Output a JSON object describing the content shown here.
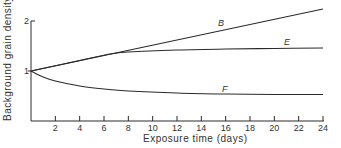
{
  "chart_data": {
    "type": "line",
    "title": "",
    "xlabel": "Exposure time (days)",
    "ylabel": "Background grain density",
    "xlim": [
      0,
      24
    ],
    "ylim": [
      0,
      2
    ],
    "x_ticks": [
      2,
      4,
      6,
      8,
      10,
      12,
      14,
      16,
      18,
      20,
      22,
      24
    ],
    "y_ticks": [
      1,
      2
    ],
    "grid": false,
    "legend": "inline labels",
    "series": [
      {
        "name": "B",
        "x": [
          0,
          6,
          12,
          18,
          24
        ],
        "y": [
          1.0,
          1.31,
          1.62,
          1.93,
          2.24
        ]
      },
      {
        "name": "E",
        "x": [
          0,
          4,
          6.5,
          8,
          12,
          16,
          20,
          24
        ],
        "y": [
          1.0,
          1.21,
          1.34,
          1.38,
          1.42,
          1.44,
          1.45,
          1.46
        ]
      },
      {
        "name": "F",
        "x": [
          0,
          1,
          2,
          4,
          6,
          8,
          12,
          16,
          20,
          24
        ],
        "y": [
          1.0,
          0.88,
          0.8,
          0.7,
          0.64,
          0.6,
          0.56,
          0.54,
          0.53,
          0.53
        ]
      }
    ]
  },
  "labels": {
    "xlabel": "Exposure time (days)",
    "ylabel": "Background grain density",
    "y2": "2",
    "y1": "1",
    "x_ticks": [
      "2",
      "4",
      "6",
      "8",
      "10",
      "12",
      "14",
      "16",
      "18",
      "20",
      "22",
      "24"
    ],
    "curve_B": "B",
    "curve_E": "E",
    "curve_F": "F"
  }
}
